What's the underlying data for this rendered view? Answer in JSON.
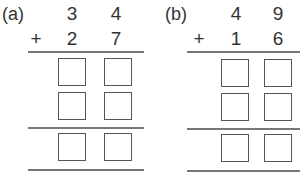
{
  "problems": [
    {
      "label": "(a)",
      "top": [
        "3",
        "4"
      ],
      "operator": "+",
      "bottom": [
        "2",
        "7"
      ]
    },
    {
      "label": "(b)",
      "top": [
        "4",
        "9"
      ],
      "operator": "+",
      "bottom": [
        "1",
        "6"
      ]
    }
  ]
}
